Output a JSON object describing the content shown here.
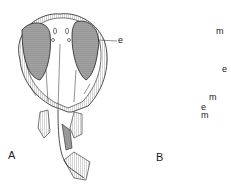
{
  "figure": {
    "panels": [
      {
        "id": "A",
        "label": "A",
        "annotations": [
          {
            "text": "e"
          }
        ]
      },
      {
        "id": "B",
        "label": "B",
        "annotations": [
          {
            "text": "m"
          },
          {
            "text": "e"
          },
          {
            "text": "m"
          },
          {
            "text": "e"
          },
          {
            "text": "m"
          }
        ]
      }
    ]
  },
  "colors": {
    "ink": "#222222",
    "shade": "#8a8a8a",
    "background": "#ffffff"
  }
}
